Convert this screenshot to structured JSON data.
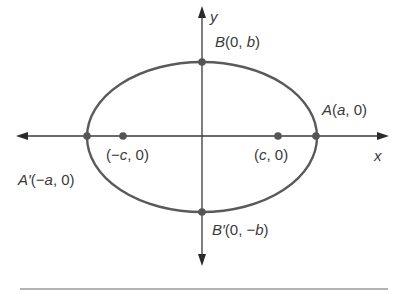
{
  "diagram": {
    "axes": {
      "x_label": "x",
      "y_label": "y"
    },
    "points": {
      "A": {
        "name": "A",
        "coords": "(a, 0)"
      },
      "A_prime": {
        "name": "A′",
        "coords": "(−a, 0)"
      },
      "B": {
        "name": "B",
        "coords": "(0, b)"
      },
      "B_prime": {
        "name": "B′",
        "coords": "(0, −b)"
      },
      "focus_right": {
        "coords": "(c, 0)",
        "c_label": "c"
      },
      "focus_left": {
        "coords": "(−c, 0)"
      }
    },
    "label_parts": {
      "A_open": "(",
      "A_var": "a",
      "A_rest": ", 0)",
      "Ap_open": "(−",
      "Ap_var": "a",
      "Ap_rest": ", 0)",
      "B_open": "(0, ",
      "B_var": "b",
      "B_rest": ")",
      "Bp_open": "(0, −",
      "Bp_var": "b",
      "Bp_rest": ")",
      "F1_open": "(−",
      "F1_var": "c",
      "F1_rest": ", 0)",
      "F2_open": "(",
      "F2_var": "c",
      "F2_rest": ", 0)"
    },
    "colors": {
      "ink": "#3a3a3a",
      "curve": "#5a5a5a"
    }
  }
}
